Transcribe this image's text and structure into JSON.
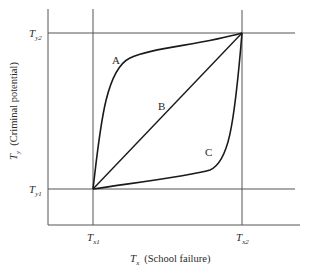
{
  "diagram": {
    "y_axis": {
      "symbol": "T",
      "subscript": "y",
      "label": "(Criminal potential)",
      "ticks": [
        {
          "symbol": "T",
          "subscript": "y2"
        },
        {
          "symbol": "T",
          "subscript": "y1"
        }
      ]
    },
    "x_axis": {
      "symbol": "T",
      "subscript": "x",
      "label": "(School failure)",
      "ticks": [
        {
          "symbol": "T",
          "subscript": "x1"
        },
        {
          "symbol": "T",
          "subscript": "x2"
        }
      ]
    },
    "curves": [
      {
        "name": "A",
        "label": "A",
        "shape": "concave (rises steeply then levels)"
      },
      {
        "name": "B",
        "label": "B",
        "shape": "linear diagonal"
      },
      {
        "name": "C",
        "label": "C",
        "shape": "convex (flat then rises steeply)"
      }
    ],
    "colors": {
      "curve": "#1a1a1a",
      "grid": "#555555",
      "text": "#2a2a2a"
    }
  }
}
